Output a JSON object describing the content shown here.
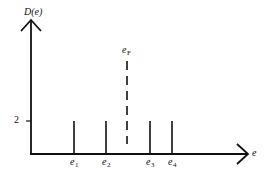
{
  "diagram": {
    "type": "density-of-states",
    "y_axis": {
      "label": "D(e)",
      "tick_label": "2"
    },
    "x_axis": {
      "label": "e"
    },
    "levels": [
      {
        "name": "e",
        "sub": "1"
      },
      {
        "name": "e",
        "sub": "2"
      },
      {
        "name": "e",
        "sub": "3"
      },
      {
        "name": "e",
        "sub": "4"
      }
    ],
    "fermi": {
      "name": "e",
      "sub": "F"
    },
    "colors": {
      "ink": "#111111",
      "background": "#ffffff"
    }
  }
}
